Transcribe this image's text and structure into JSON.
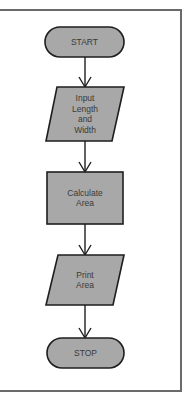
{
  "diagram": {
    "type": "flowchart",
    "colors": {
      "shape_fill": "#a8a8a8",
      "shape_stroke": "#1e1e1e",
      "text": "#3a3a3a",
      "frame": "#6a6a6a",
      "background": "#ffffff"
    },
    "nodes": [
      {
        "id": "start",
        "shape": "terminal",
        "lines": [
          "START"
        ]
      },
      {
        "id": "input",
        "shape": "parallelogram",
        "lines": [
          "Input",
          "Length",
          "and",
          "Width"
        ]
      },
      {
        "id": "calc",
        "shape": "rectangle",
        "lines": [
          "Calculate",
          "Area"
        ]
      },
      {
        "id": "print",
        "shape": "parallelogram",
        "lines": [
          "Print",
          "Area"
        ]
      },
      {
        "id": "stop",
        "shape": "terminal",
        "lines": [
          "STOP"
        ]
      }
    ],
    "edges": [
      {
        "from": "start",
        "to": "input"
      },
      {
        "from": "input",
        "to": "calc"
      },
      {
        "from": "calc",
        "to": "print"
      },
      {
        "from": "print",
        "to": "stop"
      }
    ]
  }
}
